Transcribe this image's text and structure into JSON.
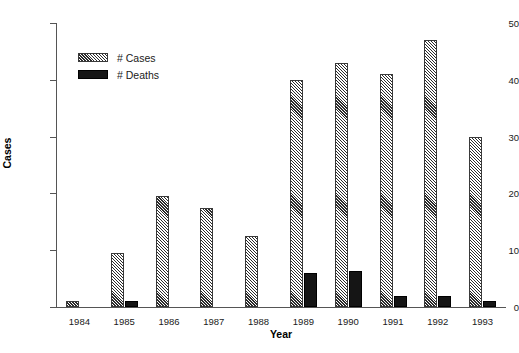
{
  "chart_data": {
    "type": "bar",
    "title": "",
    "xlabel": "Year",
    "ylabel": "Cases",
    "categories": [
      "1984",
      "1985",
      "1986",
      "1987",
      "1988",
      "1989",
      "1990",
      "1991",
      "1992",
      "1993"
    ],
    "series": [
      {
        "name": "# Cases",
        "values": [
          1,
          9.5,
          19.5,
          17.5,
          12.5,
          40,
          43,
          41,
          47,
          30
        ],
        "fill": "diagonal-hatch",
        "color": "#2b2b2b"
      },
      {
        "name": "# Deaths",
        "values": [
          0,
          1,
          0,
          0,
          0,
          6,
          6.3,
          2,
          2,
          1
        ],
        "fill": "solid",
        "color": "#151515"
      }
    ],
    "ylim": [
      0,
      50
    ],
    "yticks": [
      0,
      10,
      20,
      30,
      40,
      50
    ],
    "ytick_labels": [
      "0",
      "10",
      "20",
      "30",
      "40",
      "50"
    ],
    "grid": false,
    "legend_position": "upper-left"
  },
  "legend": {
    "items": [
      {
        "label": "# Cases"
      },
      {
        "label": "# Deaths"
      }
    ]
  }
}
